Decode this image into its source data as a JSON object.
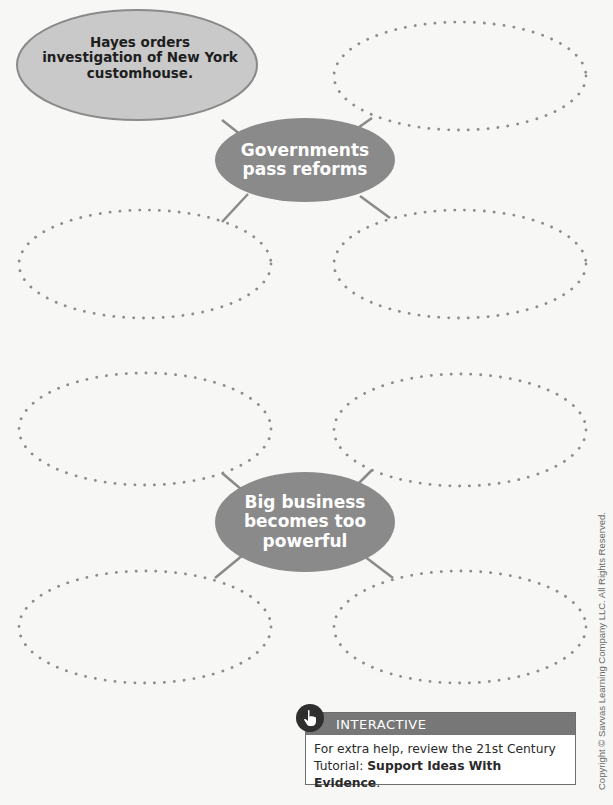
{
  "diagram": {
    "type": "concept-web",
    "hubs": [
      {
        "id": "governments",
        "label": "Governments pass reforms",
        "label_lines": [
          "Governments",
          "pass reforms"
        ],
        "branches": [
          {
            "position": "top-left",
            "text": "Hayes orders investigation of New York customhouse.",
            "text_lines": [
              "Hayes orders",
              "investigation of New York",
              "customhouse."
            ],
            "filled": true
          },
          {
            "position": "top-right",
            "text": "",
            "filled": false
          },
          {
            "position": "bottom-left",
            "text": "",
            "filled": false
          },
          {
            "position": "bottom-right",
            "text": "",
            "filled": false
          }
        ]
      },
      {
        "id": "big-business",
        "label": "Big business becomes too powerful",
        "label_lines": [
          "Big business",
          "becomes too",
          "powerful"
        ],
        "branches": [
          {
            "position": "top-left",
            "text": "",
            "filled": false
          },
          {
            "position": "top-right",
            "text": "",
            "filled": false
          },
          {
            "position": "bottom-left",
            "text": "",
            "filled": false
          },
          {
            "position": "bottom-right",
            "text": "",
            "filled": false
          }
        ]
      }
    ]
  },
  "interactive": {
    "icon": "hand-pointer-icon",
    "header": "INTERACTIVE",
    "body_prefix": "For extra help, review the 21st Century Tutorial: ",
    "body_link": "Support Ideas With Evidence",
    "body_suffix": "."
  },
  "colors": {
    "hub_fill": "#8a8a8a",
    "filled_node_fill": "#c9c9c9",
    "dotted_stroke": "#8c8c8c",
    "connector": "#8a8a8a",
    "interactive_header": "#777777"
  },
  "copyright": "Copyright © Savvas Learning Company LLC. All Rights Reserved."
}
